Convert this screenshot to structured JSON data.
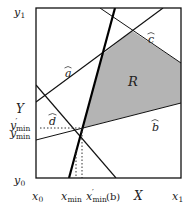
{
  "figure": {
    "region_label": "R",
    "region_fill": "#b4b4b4",
    "line_labels": {
      "a": "a",
      "b": "b",
      "c": "c",
      "d": "d"
    },
    "y_axis_labels": {
      "y1": "y",
      "y1_sub": "1",
      "Y": "Y",
      "ymin_prime": "y",
      "ymin_prime_sub": "min",
      "ymin": "y",
      "ymin_sub": "min",
      "y0": "y",
      "y0_sub": "0"
    },
    "x_axis_labels": {
      "x0": "x",
      "x0_sub": "0",
      "xmin": "x",
      "xmin_sub": "min",
      "xmin_prime": "x",
      "xmin_prime_sub": "min",
      "xmin_prime_suffix": "(b)",
      "X": "X",
      "x1": "x",
      "x1_sub": "1"
    },
    "prime": "′",
    "hat": "⌢"
  }
}
